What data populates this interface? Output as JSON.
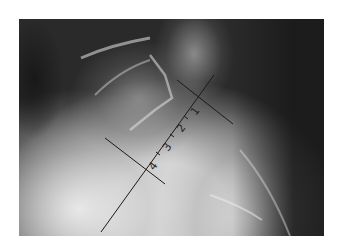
{
  "image": {
    "description": "Lateral radiograph of sacrococcygeal region with measurement lines",
    "background_color": "#ffffff",
    "line_color": "#1a1a1a"
  },
  "annotations": {
    "segment_labels": [
      "1",
      "2",
      "3",
      "4"
    ],
    "main_axis": {
      "x1": 101,
      "y1": 232,
      "x2": 214,
      "y2": 75
    },
    "upper_perpendicular": {
      "x1": 177,
      "y1": 80,
      "x2": 233,
      "y2": 124
    },
    "lower_perpendicular": {
      "x1": 105,
      "y1": 138,
      "x2": 165,
      "y2": 184
    }
  }
}
